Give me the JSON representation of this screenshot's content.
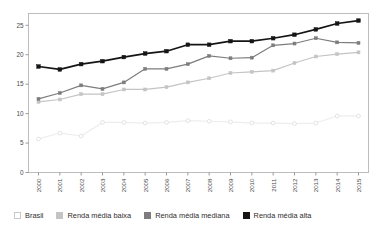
{
  "chart_data": {
    "type": "line",
    "title": "",
    "subtitle": "",
    "xlabel": "",
    "ylabel": "",
    "categories": [
      "2000",
      "2001",
      "2002",
      "2003",
      "2004",
      "2005",
      "2006",
      "2007",
      "2008",
      "2009",
      "2010",
      "2011",
      "2012",
      "2013",
      "2014",
      "2015"
    ],
    "x": [
      2000,
      2001,
      2002,
      2003,
      2004,
      2005,
      2006,
      2007,
      2008,
      2009,
      2010,
      2011,
      2012,
      2013,
      2014,
      2015
    ],
    "ylim": [
      0,
      27
    ],
    "xlim": [
      2000,
      2015
    ],
    "yticks": [
      0,
      5,
      10,
      15,
      20,
      25
    ],
    "ytick_labels": [
      "0",
      "5",
      "10",
      "15",
      "20",
      "25"
    ],
    "grid": false,
    "legend_position": "bottom",
    "series": [
      {
        "name": "Brasil",
        "color": "#f2f2f2",
        "marker": "circle-open",
        "values": [
          5.7,
          6.7,
          6.2,
          8.5,
          8.5,
          8.4,
          8.5,
          8.8,
          8.7,
          8.6,
          8.4,
          8.4,
          8.3,
          8.4,
          9.6,
          9.6
        ]
      },
      {
        "name": "Renda média baixa",
        "color": "#c4c4c4",
        "marker": "square",
        "values": [
          12.0,
          12.4,
          13.3,
          13.3,
          14.1,
          14.1,
          14.5,
          15.3,
          16.0,
          16.9,
          17.1,
          17.3,
          18.6,
          19.7,
          20.1,
          20.4
        ]
      },
      {
        "name": "Renda média mediana",
        "color": "#7d7d7d",
        "marker": "square",
        "values": [
          12.5,
          13.5,
          14.8,
          14.2,
          15.3,
          17.6,
          17.6,
          18.4,
          19.8,
          19.4,
          19.5,
          21.6,
          21.9,
          22.8,
          22.1,
          22.0
        ]
      },
      {
        "name": "Renda média alta",
        "color": "#151515",
        "marker": "square",
        "values": [
          18.0,
          17.5,
          18.4,
          18.9,
          19.6,
          20.2,
          20.6,
          21.7,
          21.7,
          22.3,
          22.3,
          22.8,
          23.4,
          24.3,
          25.3,
          25.8
        ]
      }
    ]
  },
  "legend": {
    "items": [
      {
        "label": "Brasil",
        "color": "#ffffff"
      },
      {
        "label": "Renda média baixa",
        "color": "#c4c4c4"
      },
      {
        "label": "Renda média mediana",
        "color": "#7d7d7d"
      },
      {
        "label": "Renda média alta",
        "color": "#151515"
      }
    ]
  },
  "axes": {
    "y_tick_labels": [
      "25",
      "20",
      "15",
      "10",
      "5",
      "0"
    ],
    "x_tick_labels": [
      "2000",
      "2001",
      "2002",
      "2003",
      "2004",
      "2005",
      "2006",
      "2007",
      "2008",
      "2009",
      "2010",
      "2011",
      "2012",
      "2013",
      "2014",
      "2015"
    ]
  }
}
